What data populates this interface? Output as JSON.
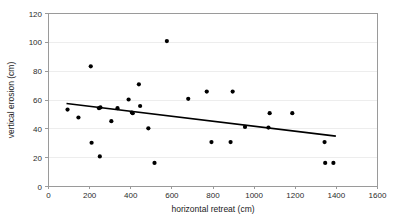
{
  "chart_data": {
    "type": "scatter",
    "title": "",
    "xlabel": "horizontal retreat (cm)",
    "ylabel": "vertical erosion (cm)",
    "xlim": [
      0,
      1600
    ],
    "ylim": [
      0,
      120
    ],
    "xticks": [
      0,
      200,
      400,
      600,
      800,
      1000,
      1200,
      1400,
      1600
    ],
    "yticks": [
      0,
      20,
      40,
      60,
      80,
      100,
      120
    ],
    "grid": "horizontal",
    "legend": "none",
    "marker_color": "#000000",
    "trendline_color": "#000000",
    "gridline_color": "#ededed",
    "frame_color": "#9a9a9a",
    "background_color": "#ffffff",
    "points": [
      {
        "x": 95,
        "y": 53
      },
      {
        "x": 148,
        "y": 47.5
      },
      {
        "x": 208,
        "y": 83
      },
      {
        "x": 212,
        "y": 30
      },
      {
        "x": 248,
        "y": 54
      },
      {
        "x": 255,
        "y": 54.5
      },
      {
        "x": 252,
        "y": 20.5
      },
      {
        "x": 308,
        "y": 45
      },
      {
        "x": 338,
        "y": 54
      },
      {
        "x": 392,
        "y": 60
      },
      {
        "x": 408,
        "y": 51
      },
      {
        "x": 412,
        "y": 50.5
      },
      {
        "x": 442,
        "y": 70.5
      },
      {
        "x": 448,
        "y": 55.5
      },
      {
        "x": 488,
        "y": 40
      },
      {
        "x": 518,
        "y": 16
      },
      {
        "x": 578,
        "y": 100.5
      },
      {
        "x": 682,
        "y": 60.5
      },
      {
        "x": 772,
        "y": 65.5
      },
      {
        "x": 795,
        "y": 30.5
      },
      {
        "x": 888,
        "y": 30.5
      },
      {
        "x": 898,
        "y": 65.5
      },
      {
        "x": 958,
        "y": 41
      },
      {
        "x": 1072,
        "y": 40.5
      },
      {
        "x": 1078,
        "y": 50.5
      },
      {
        "x": 1188,
        "y": 50.5
      },
      {
        "x": 1345,
        "y": 30.5
      },
      {
        "x": 1348,
        "y": 16
      },
      {
        "x": 1388,
        "y": 16
      }
    ],
    "trendline": {
      "x1": 90,
      "y1": 57.2,
      "x2": 1400,
      "y2": 34.6
    }
  }
}
